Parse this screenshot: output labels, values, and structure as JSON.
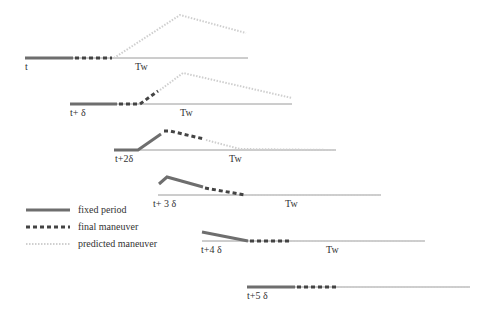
{
  "diagram": {
    "title": "",
    "colors": {
      "fixed": "#6e6e6e",
      "final": "#444444",
      "predicted": "#cfcfcf",
      "axis": "#9a9a9a",
      "text": "#333333"
    },
    "legend": {
      "items": [
        {
          "label": "fixed period",
          "style": "solid"
        },
        {
          "label": "final maneuver",
          "style": "dashed"
        },
        {
          "label": "predicted maneuver",
          "style": "dotted"
        }
      ]
    },
    "rows": [
      {
        "time_label": "t",
        "window_label": "Tw"
      },
      {
        "time_label": "t+ δ",
        "window_label": "Tw"
      },
      {
        "time_label": "t+2δ",
        "window_label": "Tw"
      },
      {
        "time_label": "t+ 3 δ",
        "window_label": "Tw"
      },
      {
        "time_label": "t+4 δ",
        "window_label": "Tw"
      },
      {
        "time_label": "t+5 δ",
        "window_label": ""
      }
    ]
  }
}
